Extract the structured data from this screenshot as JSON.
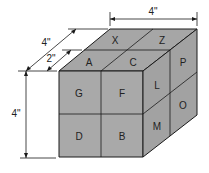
{
  "diagram": {
    "type": "isometric-cube",
    "colors": {
      "face": "#a9a9a9",
      "face_right": "#a2a2a2",
      "face_top": "#a6a6a6",
      "stroke": "#1a1a1a",
      "background": "#ffffff"
    },
    "top_face": {
      "labels": [
        "X",
        "Z",
        "A",
        "C"
      ]
    },
    "front_face": {
      "labels": [
        "G",
        "F",
        "D",
        "B"
      ]
    },
    "right_face": {
      "labels": [
        "P",
        "L",
        "O",
        "M"
      ]
    },
    "dimensions": {
      "width": "4\"",
      "depth": "4\"",
      "depth_half": "2\"",
      "height": "4\""
    }
  }
}
